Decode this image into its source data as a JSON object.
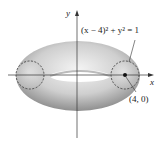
{
  "figure": {
    "type": "torus-diagram",
    "axes": {
      "x_label": "x",
      "y_label": "y"
    },
    "equation_label": "(x − 4)² + y² = 1",
    "point_label": "(4, 0)",
    "colors": {
      "torus_light": "#f2f2f2",
      "torus_dark": "#9a9a9a",
      "axis": "#333333",
      "dashed_circle": "#333333"
    }
  }
}
